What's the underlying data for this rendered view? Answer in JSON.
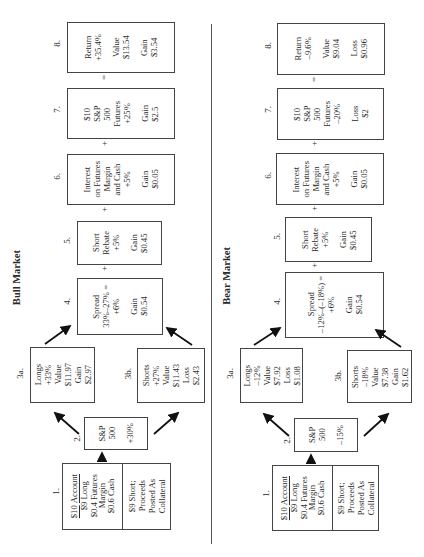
{
  "bull": {
    "title": "Bull Market",
    "step1": {
      "label": "1.",
      "account": "$10",
      "account_word": "Account",
      "long": "$9 Long",
      "margin_a": "$0.4 Futures",
      "margin_b": "Margin",
      "cash": "$0.6 Cash",
      "short_a": "$9 Short;",
      "short_b": "Proceeds",
      "short_c": "Posted As",
      "short_d": "Collateral"
    },
    "step2": {
      "label": "2.",
      "line1": "S&P",
      "line2": "500",
      "change": "+30%"
    },
    "step3a": {
      "label": "3a.",
      "l1": "Longs",
      "l2": "+33%",
      "l3": "Value",
      "l4": "$11.97",
      "l5": "Gain",
      "l6": "$2.97"
    },
    "step3b": {
      "label": "3b.",
      "l1": "Shorts",
      "l2": "+27%",
      "l3": "Value",
      "l4": "$11.43",
      "l5": "Loss",
      "l6": "$2.43"
    },
    "step4": {
      "label": "4.",
      "l1": "Spread",
      "l2": "33%–27% =",
      "l3": "+6%",
      "l4": "Gain",
      "l5": "$0.54"
    },
    "step5": {
      "label": "5.",
      "l1": "Short",
      "l2": "Rebate",
      "l3": "+5%",
      "l4": "Gain",
      "l5": "$0.45"
    },
    "step6": {
      "label": "6.",
      "l1": "Interest",
      "l2": "on Futures",
      "l3": "Margin",
      "l4": "and Cash",
      "l5": "+5%",
      "l6": "Gain",
      "l7": "$0.05"
    },
    "step7": {
      "label": "7.",
      "l1": "$10",
      "l2": "S&P",
      "l3": "500",
      "l4": "Futures",
      "l5": "+25%",
      "l6": "Gain",
      "l7": "$2.5"
    },
    "step8": {
      "label": "8.",
      "l1": "Return",
      "l2": "+35.4%",
      "l3": "Value",
      "l4": "$13.54",
      "l5": "Gain",
      "l6": "$3.54"
    }
  },
  "bear": {
    "title": "Bear Market",
    "step1": {
      "label": "1.",
      "account": "$10",
      "account_word": "Account",
      "long": "$9 Long",
      "margin_a": "$0.4 Futures",
      "margin_b": "Margin",
      "cash": "$0.6 Cash",
      "short_a": "$9 Short;",
      "short_b": "Proceeds",
      "short_c": "Posted As",
      "short_d": "Collateral"
    },
    "step2": {
      "label": "2.",
      "line1": "S&P",
      "line2": "500",
      "change": "–15%"
    },
    "step3a": {
      "label": "3a.",
      "l1": "Longs",
      "l2": "–12%",
      "l3": "Value",
      "l4": "$7.92",
      "l5": "Loss",
      "l6": "$1.08"
    },
    "step3b": {
      "label": "3b.",
      "l1": "Shorts",
      "l2": "–18%",
      "l3": "Value",
      "l4": "$7.38",
      "l5": "Gain",
      "l6": "$1.62"
    },
    "step4": {
      "label": "4.",
      "l1": "Spread",
      "l2": "–12%–(–18%) =",
      "l3": "+6%",
      "l4": "Gain",
      "l5": "$0.54"
    },
    "step5": {
      "label": "5.",
      "l1": "Short",
      "l2": "Rebate",
      "l3": "+5%",
      "l4": "Gain",
      "l5": "$0.45"
    },
    "step6": {
      "label": "6.",
      "l1": "Interest",
      "l2": "on Futures",
      "l3": "Margin",
      "l4": "and Cash",
      "l5": "+5%",
      "l6": "Gain",
      "l7": "$0.05"
    },
    "step7": {
      "label": "7.",
      "l1": "$10",
      "l2": "S&P",
      "l3": "500",
      "l4": "Futures",
      "l5": "–20%",
      "l6": "Loss",
      "l7": "$2"
    },
    "step8": {
      "label": "8.",
      "l1": "Return",
      "l2": "–9.6%",
      "l3": "Value",
      "l4": "$9.04",
      "l5": "Loss",
      "l6": "$0.96"
    }
  },
  "symbols": {
    "plus": "+",
    "equals": "="
  }
}
